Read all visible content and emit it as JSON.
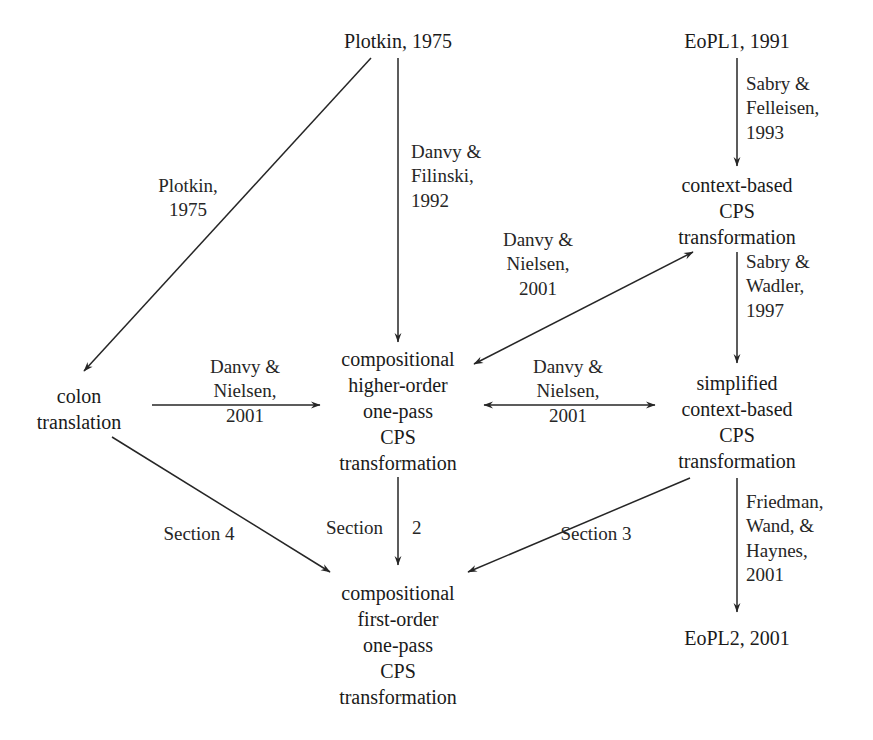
{
  "figure": {
    "type": "directed-graph",
    "title": "",
    "background": "#ffffff",
    "stroke_color": "#262626",
    "text_color": "#1a1a1a"
  },
  "nodes": [
    {
      "id": "plotkin1975",
      "label": "Plotkin, 1975",
      "x": 398,
      "y": 28
    },
    {
      "id": "eopl1",
      "label": "EoPL1, 1991",
      "x": 737,
      "y": 28
    },
    {
      "id": "context_based",
      "label": "context-based\nCPS\ntransformation",
      "x": 737,
      "y": 172
    },
    {
      "id": "colon",
      "label": "colon\ntranslation",
      "x": 79,
      "y": 383
    },
    {
      "id": "higher_order",
      "label": "compositional\nhigher-order\none-pass\nCPS\ntransformation",
      "x": 398,
      "y": 346
    },
    {
      "id": "simplified",
      "label": "simplified\ncontext-based\nCPS\ntransformation",
      "x": 737,
      "y": 370
    },
    {
      "id": "first_order",
      "label": "compositional\nfirst-order\none-pass\nCPS\ntransformation",
      "x": 398,
      "y": 580
    },
    {
      "id": "eopl2",
      "label": "EoPL2, 2001",
      "x": 737,
      "y": 625
    }
  ],
  "edges": [
    {
      "id": "e-plotkin-colon",
      "from": "plotkin1975",
      "to": "colon",
      "label": "Plotkin,\n1975",
      "arrow": "single",
      "label_x": 188,
      "label_y": 174
    },
    {
      "id": "e-plotkin-higher",
      "from": "plotkin1975",
      "to": "higher_order",
      "label": "Danvy &\nFilinski,\n1992",
      "arrow": "single",
      "label_x": 411,
      "label_y": 140,
      "align": "right"
    },
    {
      "id": "e-eopl1-context",
      "from": "eopl1",
      "to": "context_based",
      "label": "Sabry &\nFelleisen,\n1993",
      "arrow": "single",
      "label_x": 746,
      "label_y": 72,
      "align": "right"
    },
    {
      "id": "e-context-higher",
      "from": "context_based",
      "to": "higher_order",
      "label": "Danvy &\nNielsen,\n2001",
      "arrow": "double",
      "label_x": 538,
      "label_y": 228
    },
    {
      "id": "e-context-simplified",
      "from": "context_based",
      "to": "simplified",
      "label": "Sabry &\nWadler,\n1997",
      "arrow": "single",
      "label_x": 746,
      "label_y": 250,
      "align": "right"
    },
    {
      "id": "e-colon-higher",
      "from": "colon",
      "to": "higher_order",
      "label": "Danvy &\nNielsen,\n2001",
      "arrow": "single",
      "label_x": 245,
      "label_y": 355
    },
    {
      "id": "e-higher-simplified",
      "from": "higher_order",
      "to": "simplified",
      "label": "Danvy &\nNielsen,\n2001",
      "arrow": "double",
      "label_x": 568,
      "label_y": 355
    },
    {
      "id": "e-higher-first",
      "from": "higher_order",
      "to": "first_order",
      "label": "Section",
      "arrow": "single",
      "label_x": 383,
      "label_y": 516,
      "align": "left"
    },
    {
      "id": "e-higher-first-num",
      "from": "higher_order",
      "to": "first_order",
      "label": "2",
      "arrow": "none",
      "label_x": 412,
      "label_y": 516,
      "align": "right"
    },
    {
      "id": "e-colon-first",
      "from": "colon",
      "to": "first_order",
      "label": "Section 4",
      "arrow": "single",
      "label_x": 199,
      "label_y": 522
    },
    {
      "id": "e-simplified-first",
      "from": "simplified",
      "to": "first_order",
      "label": "Section 3",
      "arrow": "single",
      "label_x": 596,
      "label_y": 522
    },
    {
      "id": "e-simplified-eopl2",
      "from": "simplified",
      "to": "eopl2",
      "label": "Friedman,\nWand, &\nHaynes,\n2001",
      "arrow": "single",
      "label_x": 746,
      "label_y": 490,
      "align": "right"
    }
  ]
}
